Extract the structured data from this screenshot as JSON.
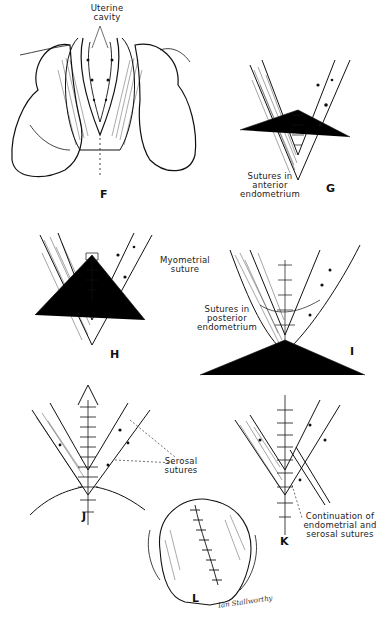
{
  "figure": {
    "panels": [
      {
        "id": "F",
        "letter": "F",
        "labels": [
          "Uterine",
          "cavity"
        ]
      },
      {
        "id": "G",
        "letter": "G",
        "labels": [
          "Sutures in",
          "anterior",
          "endometrium"
        ]
      },
      {
        "id": "H",
        "letter": "H",
        "labels": [
          "Myometrial",
          "suture"
        ]
      },
      {
        "id": "I",
        "letter": "I",
        "labels": [
          "Sutures in",
          "posterior",
          "endometrium"
        ]
      },
      {
        "id": "J",
        "letter": "J",
        "labels": [
          "Serosal",
          "sutures"
        ]
      },
      {
        "id": "K",
        "letter": "K",
        "labels": [
          "Continuation of",
          "endometrial and",
          "serosal sutures"
        ]
      },
      {
        "id": "L",
        "letter": "L",
        "labels": []
      }
    ],
    "signature": "Ian Stallworthy",
    "colors": {
      "ink": "#111111",
      "background": "#ffffff",
      "label": "#222222"
    }
  }
}
